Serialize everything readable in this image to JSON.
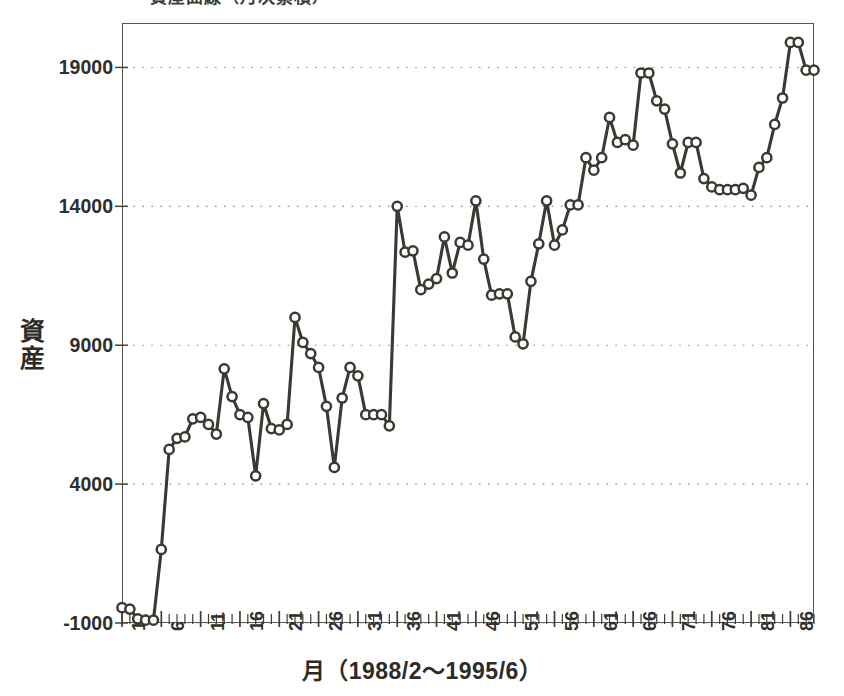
{
  "figure": {
    "cropped_top_title": "資産曲線（月次累積）",
    "background_color": "#ffffff",
    "line_color": "#3a3a33",
    "marker_fill": "#ffffff",
    "gridline_color": "#8a8a93",
    "frame_color": "#55554e"
  },
  "chart_data": {
    "type": "line",
    "title": "",
    "xlabel": "月（1988/2〜1995/6）",
    "ylabel": "資産",
    "xlim": [
      1,
      89
    ],
    "ylim": [
      -1000,
      20600
    ],
    "ytick_labels": [
      "19000",
      "14000",
      "9000",
      "4000",
      "-1000"
    ],
    "yticks": [
      19000,
      14000,
      9000,
      4000,
      -1000
    ],
    "xtick_labels": [
      "1",
      "6",
      "11",
      "16",
      "21",
      "26",
      "31",
      "36",
      "41",
      "46",
      "51",
      "56",
      "61",
      "66",
      "71",
      "76",
      "81",
      "86"
    ],
    "xticks": [
      1,
      6,
      11,
      16,
      21,
      26,
      31,
      36,
      41,
      46,
      51,
      56,
      61,
      66,
      71,
      76,
      81,
      86
    ],
    "minor_xticks_every": 1,
    "grid": "horizontal-dotted",
    "legend": null,
    "marker": "circle-open",
    "series": [
      {
        "name": "資産",
        "x": [
          1,
          2,
          3,
          4,
          5,
          6,
          7,
          8,
          9,
          10,
          11,
          12,
          13,
          14,
          15,
          16,
          17,
          18,
          19,
          20,
          21,
          22,
          23,
          24,
          25,
          26,
          27,
          28,
          29,
          30,
          31,
          32,
          33,
          34,
          35,
          36,
          37,
          38,
          39,
          40,
          41,
          42,
          43,
          44,
          45,
          46,
          47,
          48,
          49,
          50,
          51,
          52,
          53,
          54,
          55,
          56,
          57,
          58,
          59,
          60,
          61,
          62,
          63,
          64,
          65,
          66,
          67,
          68,
          69,
          70,
          71,
          72,
          73,
          74,
          75,
          76,
          77,
          78,
          79,
          80,
          81,
          82,
          83,
          84,
          85,
          86,
          87,
          88,
          89
        ],
        "values": [
          -450,
          -500,
          -850,
          -900,
          -900,
          1650,
          5250,
          5650,
          5700,
          6350,
          6400,
          6150,
          5800,
          8150,
          7150,
          6500,
          6400,
          4300,
          6900,
          6000,
          5950,
          6150,
          10000,
          9100,
          8700,
          8200,
          6800,
          4600,
          7100,
          8200,
          7900,
          6500,
          6500,
          6500,
          6100,
          14000,
          12350,
          12400,
          11000,
          11200,
          11400,
          12900,
          11600,
          12700,
          12600,
          14200,
          12100,
          10800,
          10850,
          10850,
          9300,
          9050,
          11300,
          12650,
          14200,
          12600,
          13150,
          14050,
          14050,
          15750,
          15300,
          15750,
          17200,
          16300,
          16400,
          16200,
          18800,
          18800,
          17800,
          17500,
          16250,
          15200,
          16300,
          16300,
          15000,
          14700,
          14600,
          14600,
          14600,
          14650,
          14400,
          15400,
          15750,
          16950,
          17900,
          19900,
          19900,
          18900,
          18900
        ]
      }
    ]
  }
}
